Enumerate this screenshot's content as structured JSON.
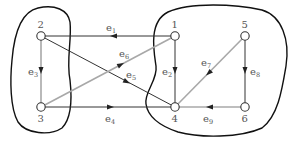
{
  "diagram": {
    "type": "directed-graph",
    "colors": {
      "dark_edge": "#333333",
      "gray_edge": "#a8a8a8",
      "blob": "#111111",
      "node_fill": "#ffffff",
      "node_stroke": "#333333",
      "label": "#555555"
    },
    "nodes": [
      {
        "id": "1",
        "label": "1",
        "x": 175,
        "y": 36
      },
      {
        "id": "2",
        "label": "2",
        "x": 41,
        "y": 36
      },
      {
        "id": "3",
        "label": "3",
        "x": 41,
        "y": 107
      },
      {
        "id": "4",
        "label": "4",
        "x": 175,
        "y": 107
      },
      {
        "id": "5",
        "label": "5",
        "x": 245,
        "y": 36
      },
      {
        "id": "6",
        "label": "6",
        "x": 245,
        "y": 107
      }
    ],
    "edges": [
      {
        "id": "e1",
        "base": "e",
        "sub": "1",
        "from": "1",
        "to": "2",
        "style": "dark"
      },
      {
        "id": "e2",
        "base": "e",
        "sub": "2",
        "from": "1",
        "to": "4",
        "style": "dark"
      },
      {
        "id": "e3",
        "base": "e",
        "sub": "3",
        "from": "2",
        "to": "3",
        "style": "gray"
      },
      {
        "id": "e4",
        "base": "e",
        "sub": "4",
        "from": "3",
        "to": "4",
        "style": "dark"
      },
      {
        "id": "e5",
        "base": "e",
        "sub": "5",
        "from": "2",
        "to": "4",
        "style": "dark"
      },
      {
        "id": "e6",
        "base": "e",
        "sub": "6",
        "from": "3",
        "to": "1",
        "style": "gray"
      },
      {
        "id": "e7",
        "base": "e",
        "sub": "7",
        "from": "5",
        "to": "4",
        "style": "gray"
      },
      {
        "id": "e8",
        "base": "e",
        "sub": "8",
        "from": "5",
        "to": "6",
        "style": "dark"
      },
      {
        "id": "e9",
        "base": "e",
        "sub": "9",
        "from": "6",
        "to": "4",
        "style": "gray"
      }
    ],
    "regions": [
      {
        "id": "left-cut-region",
        "contains": [
          "2",
          "3"
        ]
      },
      {
        "id": "right-cut-region",
        "contains": [
          "1",
          "4",
          "5",
          "6"
        ]
      }
    ]
  }
}
